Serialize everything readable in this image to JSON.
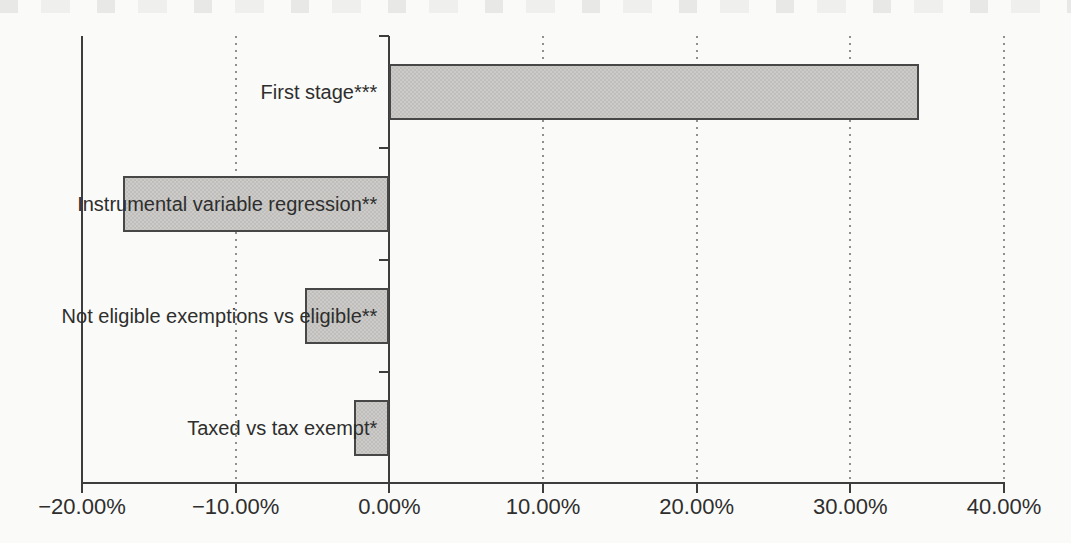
{
  "figure": {
    "background_color": "#fafaf8",
    "text_color": "#2e2e2e",
    "axis_color": "#3d3d3d",
    "grid_color": "#8f8f8f"
  },
  "chart_data": {
    "type": "bar",
    "orientation": "horizontal",
    "title": "",
    "subtitle": "",
    "xlabel": "",
    "ylabel": "",
    "legend": "none",
    "categories": [
      "First stage***",
      "Instrumental variable regression**",
      "Not eligible exemptions vs eligible**",
      "Taxed vs tax exempt*"
    ],
    "values": [
      34.5,
      -17.3,
      -5.5,
      -2.3
    ],
    "value_unit": "percent",
    "xlim": [
      -20,
      40
    ],
    "x_ticks": [
      -20,
      -10,
      0,
      10,
      20,
      30,
      40
    ],
    "x_tick_labels": [
      "−20.00%",
      "−10.00%",
      "0.00%",
      "10.00%",
      "20.00%",
      "30.00%",
      "40.00%"
    ],
    "grid": "vertical dotted gridlines at non-zero ticks; solid zero axis; solid left border; no top border",
    "bar_fill_color": "#cccbc9",
    "bar_dot_color": "#bfbebb",
    "bar_border_color": "#474747",
    "significance_note": "asterisks appended to category labels"
  }
}
